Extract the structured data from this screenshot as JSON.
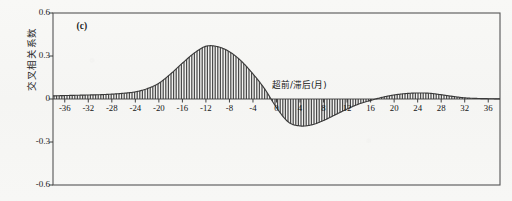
{
  "figure": {
    "panel_label": "(c)",
    "y_axis_title": "交叉相关系数",
    "x_axis_annotation": "超前/滞后(月)",
    "frame_color": "#555555",
    "curve_color": "#3a3a3a",
    "hatch_color": "#4a4a4a",
    "background_color": "#f7f7f5"
  },
  "chart_data": {
    "type": "line",
    "title": "(c)",
    "xlabel": "超前/滞后(月)",
    "ylabel": "交叉相关系数",
    "xlim": [
      -38,
      38
    ],
    "ylim": [
      -0.6,
      0.6
    ],
    "yticks": [
      0.6,
      0.3,
      0,
      -0.3,
      -0.6
    ],
    "ytick_labels": [
      "0.6",
      "0.3",
      "0",
      "-0.3",
      "-0.6"
    ],
    "xticks": [
      -36,
      -32,
      -28,
      -24,
      -20,
      -16,
      -12,
      -8,
      -4,
      0,
      4,
      8,
      12,
      16,
      20,
      24,
      28,
      32,
      36
    ],
    "xtick_labels": [
      "-36",
      "-32",
      "-28",
      "-24",
      "-20",
      "-16",
      "-12",
      "-8",
      "-4",
      "0",
      "4",
      "8",
      "12",
      "16",
      "20",
      "24",
      "28",
      "32",
      "36"
    ],
    "grid": false,
    "legend": false,
    "fill": "vertical-hatch-between-curve-and-zero",
    "zero_line": true,
    "annotations": [
      {
        "text": "超前/滞后(月)",
        "x": 4,
        "y": 0.075
      },
      {
        "text": "(c)",
        "x": -34,
        "y": 0.5
      }
    ],
    "series": [
      {
        "name": "cross-correlation",
        "x": [
          -38,
          -36,
          -34,
          -32,
          -30,
          -28,
          -26,
          -24,
          -22,
          -20,
          -18,
          -16,
          -14,
          -12,
          -10,
          -8,
          -6,
          -4,
          -2,
          0,
          2,
          4,
          6,
          8,
          10,
          12,
          14,
          16,
          18,
          20,
          22,
          24,
          26,
          28,
          30,
          32,
          34,
          36,
          38
        ],
        "values": [
          0.022,
          0.024,
          0.026,
          0.028,
          0.03,
          0.034,
          0.04,
          0.05,
          0.072,
          0.11,
          0.175,
          0.25,
          0.32,
          0.368,
          0.365,
          0.33,
          0.265,
          0.175,
          0.07,
          -0.06,
          -0.16,
          -0.188,
          -0.18,
          -0.15,
          -0.11,
          -0.07,
          -0.035,
          -0.01,
          0.012,
          0.028,
          0.038,
          0.042,
          0.04,
          0.03,
          0.018,
          0.008,
          0.004,
          0.002,
          0.001
        ]
      }
    ],
    "peak": {
      "x": -12,
      "y": 0.368
    },
    "trough": {
      "x": 4,
      "y": -0.188
    },
    "secondary_peak": {
      "x": 24,
      "y": 0.042
    }
  }
}
